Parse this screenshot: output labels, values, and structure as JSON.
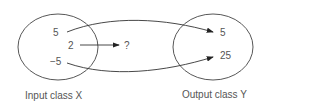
{
  "diagram": {
    "input_set": {
      "label": "Input class X",
      "elements": [
        "5",
        "2",
        "−5"
      ]
    },
    "output_set": {
      "label": "Output class Y",
      "elements": [
        "5",
        "25"
      ]
    },
    "unknown_output": "?",
    "mappings": [
      {
        "from": "5",
        "to": "5"
      },
      {
        "from": "2",
        "to": "?"
      },
      {
        "from": "−5",
        "to": "25"
      }
    ],
    "colors": {
      "stroke": "#333333",
      "text": "#555555"
    }
  }
}
